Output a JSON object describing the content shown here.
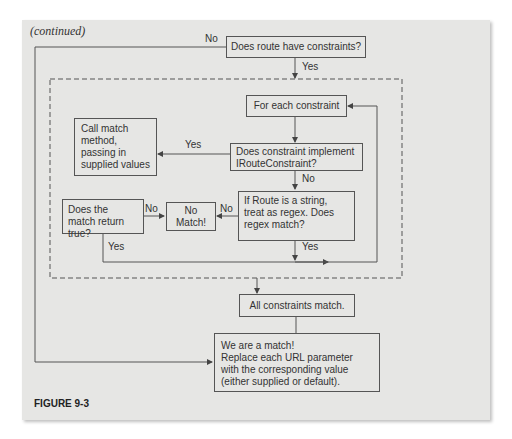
{
  "caption_top": "(continued)",
  "figure_label": "FIGURE 9-3",
  "nodes": {
    "has_constraints": "Does route have constraints?",
    "for_each": "For each constraint",
    "call_match": "Call match method, passing in supplied values",
    "implements": "Does constraint implement IRouteConstraint?",
    "regex": "If Route is a string, treat as regex. Does regex match?",
    "no_match": "No Match!",
    "match_true": "Does the match return true?",
    "all_match": "All constraints match.",
    "we_match_line1": "We are a match!",
    "we_match_line2": "Replace each URL parameter with the corresponding value (either supplied or default)."
  },
  "edges": {
    "no_top": "No",
    "yes_top": "Yes",
    "yes_implements": "Yes",
    "no_implements": "No",
    "no_regex": "No",
    "no_match_true": "No",
    "yes_match_true": "Yes",
    "yes_regex": "Yes"
  },
  "colors": {
    "background": "#e6e6e4",
    "stroke": "#555555",
    "text": "#333333"
  }
}
